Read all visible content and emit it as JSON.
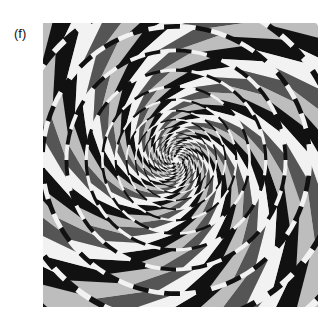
{
  "figure": {
    "panel_label": "(f)",
    "colors": {
      "dark": "#111111",
      "light": "#f2f2f2",
      "mid_dark": "#555555",
      "mid_light": "#bdbdbd"
    }
  }
}
